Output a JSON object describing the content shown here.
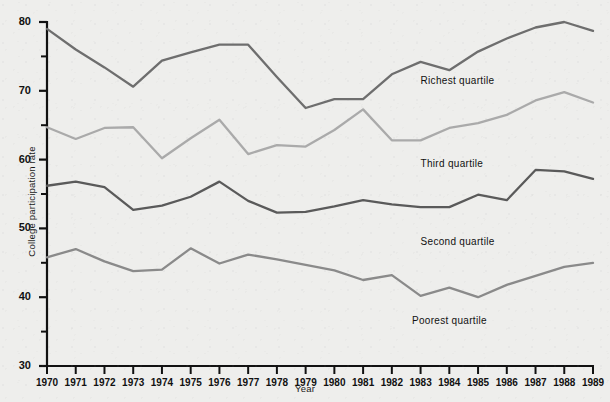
{
  "chart_data": {
    "type": "line",
    "title": "",
    "xlabel": "Year",
    "ylabel": "College participation rate",
    "categories": [
      1970,
      1971,
      1972,
      1973,
      1974,
      1975,
      1976,
      1977,
      1978,
      1979,
      1980,
      1981,
      1982,
      1983,
      1984,
      1985,
      1986,
      1987,
      1988,
      1989
    ],
    "xlim": [
      1970,
      1989
    ],
    "ylim": [
      30,
      80
    ],
    "ytick_major": [
      30,
      40,
      50,
      60,
      70,
      80
    ],
    "ytick_minor": [
      35,
      45,
      55,
      65,
      75
    ],
    "grid": false,
    "legend_position": "inline-right",
    "series": [
      {
        "name": "Richest quartile",
        "color": "#6e6e6e",
        "label_x": 1983.0,
        "label_y": 71.4,
        "values": [
          79.0,
          76.0,
          73.4,
          70.6,
          74.4,
          75.6,
          76.7,
          76.7,
          72.0,
          67.5,
          68.8,
          68.8,
          72.4,
          74.2,
          73.0,
          75.7,
          77.6,
          79.2,
          80.0,
          78.7
        ]
      },
      {
        "name": "Third quartile",
        "color": "#aaaaaa",
        "label_x": 1983.0,
        "label_y": 59.3,
        "values": [
          64.7,
          63.0,
          64.6,
          64.7,
          60.2,
          63.1,
          65.8,
          60.8,
          62.1,
          61.9,
          64.3,
          67.3,
          62.8,
          62.8,
          64.6,
          65.3,
          66.5,
          68.6,
          69.8,
          68.3
        ]
      },
      {
        "name": "Second quartile",
        "color": "#5a5a5a",
        "label_x": 1983.0,
        "label_y": 48.0,
        "values": [
          56.2,
          56.8,
          56.0,
          52.7,
          53.3,
          54.6,
          56.8,
          54.0,
          52.3,
          52.4,
          53.2,
          54.1,
          53.5,
          53.1,
          53.1,
          54.9,
          54.1,
          58.5,
          58.3,
          57.2
        ]
      },
      {
        "name": "Poorest quartile",
        "color": "#8a8a8a",
        "label_x": 1982.7,
        "label_y": 36.6,
        "values": [
          45.8,
          47.0,
          45.2,
          43.8,
          44.0,
          47.1,
          44.9,
          46.2,
          45.5,
          44.7,
          43.9,
          42.5,
          43.2,
          40.2,
          41.4,
          40.0,
          41.8,
          43.1,
          44.4,
          45.0
        ]
      }
    ]
  }
}
